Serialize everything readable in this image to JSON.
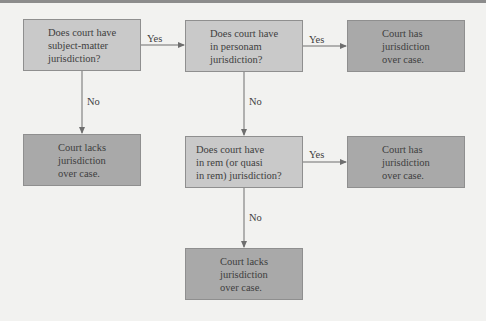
{
  "nodes": {
    "q1": {
      "lines": [
        "Does court have",
        "subject-matter",
        "jurisdiction?"
      ]
    },
    "q2": {
      "lines": [
        "Does court have",
        "in personam",
        "jurisdiction?"
      ]
    },
    "q3": {
      "lines": [
        "Does court have",
        "in rem (or quasi",
        "in rem) jurisdiction?"
      ]
    },
    "r_has_1": {
      "lines": [
        "Court has",
        "jurisdiction",
        "over case."
      ]
    },
    "r_lacks_1": {
      "lines": [
        "Court lacks",
        "jurisdiction",
        "over case."
      ]
    },
    "r_has_2": {
      "lines": [
        "Court has",
        "jurisdiction",
        "over case."
      ]
    },
    "r_lacks_2": {
      "lines": [
        "Court lacks",
        "jurisdiction",
        "over case."
      ]
    }
  },
  "edges": {
    "q1_yes": "Yes",
    "q1_no": "No",
    "q2_yes": "Yes",
    "q2_no": "No",
    "q3_yes": "Yes",
    "q3_no": "No"
  },
  "colors": {
    "question_fill": "#c9c9c9",
    "result_fill": "#a9a9a9",
    "line": "#6e6e6e"
  }
}
